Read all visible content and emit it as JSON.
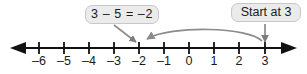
{
  "diagram": {
    "type": "number-line",
    "line_color": "#111111",
    "arc_color": "#8c8c8c",
    "leader_color": "#8c8c8c",
    "label_bg": "#ebebeb",
    "label_border": "#c8c8c8",
    "text_color": "#1a1a1a"
  },
  "callouts": {
    "equation": {
      "text": "3 – 5 = –2",
      "points_to": "-2"
    },
    "start": {
      "text": "Start at 3",
      "points_to": "3"
    }
  },
  "number_line": {
    "min": -6,
    "max": 3,
    "step": 1,
    "left_arrow": true,
    "right_arrow": true,
    "ticks": [
      {
        "value": -6,
        "label": "–6",
        "x": 39
      },
      {
        "value": -5,
        "label": "–5",
        "x": 64
      },
      {
        "value": -4,
        "label": "–4",
        "x": 89
      },
      {
        "value": -3,
        "label": "–3",
        "x": 114
      },
      {
        "value": -2,
        "label": "–2",
        "x": 139
      },
      {
        "value": -1,
        "label": "–1",
        "x": 164
      },
      {
        "value": 0,
        "label": "0",
        "x": 189
      },
      {
        "value": 1,
        "label": "1",
        "x": 214
      },
      {
        "value": 2,
        "label": "2",
        "x": 239
      },
      {
        "value": 3,
        "label": "3",
        "x": 265
      }
    ]
  },
  "jump_arc": {
    "from_value": 3,
    "to_value": -2,
    "direction": "left",
    "magnitude": 5
  }
}
